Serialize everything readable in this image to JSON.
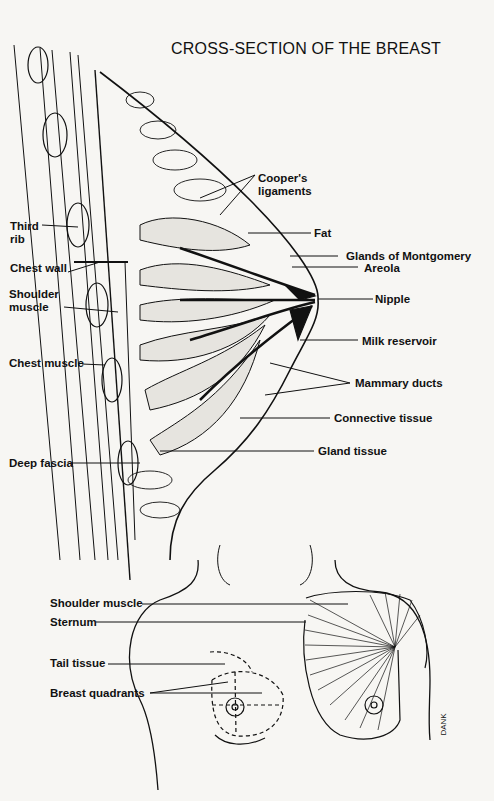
{
  "title": "CROSS-SECTION OF THE BREAST",
  "cross_section_labels": {
    "coopers_ligaments": "Cooper's\nligaments",
    "coopers_line1": "Cooper's",
    "coopers_line2": "ligaments",
    "fat": "Fat",
    "glands_of_montgomery": "Glands of Montgomery",
    "areola": "Areola",
    "nipple": "Nipple",
    "milk_reservoir": "Milk reservoir",
    "mammary_ducts": "Mammary ducts",
    "connective_tissue": "Connective tissue",
    "gland_tissue": "Gland tissue",
    "third_rib_line1": "Third",
    "third_rib_line2": "rib",
    "chest_wall": "Chest wall",
    "shoulder_muscle_line1": "Shoulder",
    "shoulder_muscle_line2": "muscle",
    "chest_muscle": "Chest muscle",
    "deep_fascia": "Deep fascia"
  },
  "front_view_labels": {
    "shoulder_muscle": "Shoulder muscle",
    "sternum": "Sternum",
    "tail_tissue": "Tail tissue",
    "breast_quadrants": "Breast quadrants"
  },
  "signature": "DANK"
}
